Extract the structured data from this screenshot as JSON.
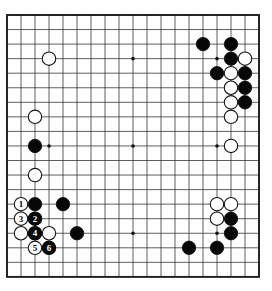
{
  "figure": {
    "kind": "go-board-diagram",
    "board_size": 19
  },
  "colors": {
    "background": "#fefefe",
    "grid_line": "#2b2b2b",
    "border": "#1c1c1c",
    "black_stone": "#070707",
    "white_stone": "#ffffff",
    "white_stone_outline": "#161616",
    "star_point": "#111111"
  },
  "board": {
    "size": 19,
    "star_points": [
      {
        "col": 10,
        "row": 4
      },
      {
        "col": 16,
        "row": 4
      },
      {
        "col": 4,
        "row": 10
      },
      {
        "col": 10,
        "row": 10
      },
      {
        "col": 16,
        "row": 10
      },
      {
        "col": 10,
        "row": 16
      },
      {
        "col": 16,
        "row": 16
      }
    ],
    "white_stones": [
      {
        "col": 4,
        "row": 4
      },
      {
        "col": 3,
        "row": 8
      },
      {
        "col": 3,
        "row": 12
      },
      {
        "col": 2,
        "row": 16
      },
      {
        "col": 4,
        "row": 16
      },
      {
        "col": 18,
        "row": 4
      },
      {
        "col": 17,
        "row": 5
      },
      {
        "col": 17,
        "row": 6
      },
      {
        "col": 17,
        "row": 7
      },
      {
        "col": 17,
        "row": 8
      },
      {
        "col": 17,
        "row": 10
      },
      {
        "col": 16,
        "row": 14
      },
      {
        "col": 17,
        "row": 14
      },
      {
        "col": 16,
        "row": 15
      }
    ],
    "black_stones": [
      {
        "col": 15,
        "row": 3
      },
      {
        "col": 17,
        "row": 3
      },
      {
        "col": 17,
        "row": 4
      },
      {
        "col": 16,
        "row": 5
      },
      {
        "col": 18,
        "row": 5
      },
      {
        "col": 18,
        "row": 6
      },
      {
        "col": 18,
        "row": 7
      },
      {
        "col": 3,
        "row": 10
      },
      {
        "col": 3,
        "row": 14
      },
      {
        "col": 5,
        "row": 14
      },
      {
        "col": 6,
        "row": 16
      },
      {
        "col": 17,
        "row": 15
      },
      {
        "col": 17,
        "row": 16
      },
      {
        "col": 14,
        "row": 17
      },
      {
        "col": 16,
        "row": 17
      }
    ],
    "numbered_moves": [
      {
        "number": "1",
        "color": "white",
        "col": 2,
        "row": 14
      },
      {
        "number": "2",
        "color": "black",
        "col": 3,
        "row": 15
      },
      {
        "number": "3",
        "color": "white",
        "col": 2,
        "row": 15
      },
      {
        "number": "4",
        "color": "black",
        "col": 3,
        "row": 16
      },
      {
        "number": "5",
        "color": "white",
        "col": 3,
        "row": 17
      },
      {
        "number": "6",
        "color": "black",
        "col": 4,
        "row": 17
      }
    ]
  },
  "geometry": {
    "image_width": 272,
    "image_height": 291,
    "left_edge_x": 7,
    "top_edge_y": 15,
    "col_spacing": 14.0,
    "row_spacing": 14.55,
    "stone_radius": 6.7,
    "star_radius": 1.8,
    "move_number_font_size": 9
  }
}
